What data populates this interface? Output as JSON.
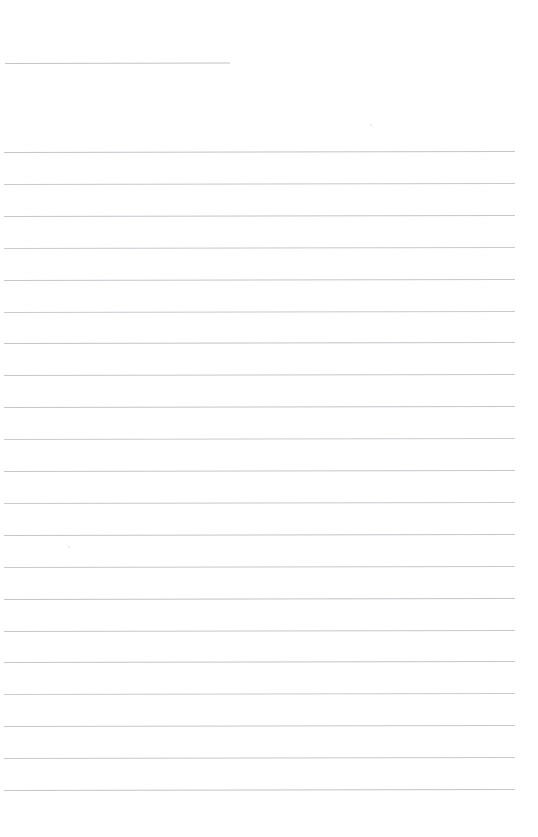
{
  "page": {
    "kind": "blank-lined-worksheet-page",
    "width": 538,
    "height": 837,
    "background_color": "#ffffff",
    "title_text": "",
    "body_text": ""
  },
  "colors": {
    "rule": "#c6c6ca",
    "rule_faint": "#d6d6da",
    "rule_strong": "#bcbcc2",
    "background": "#ffffff",
    "speck": "#e4e4e7"
  },
  "header_rule": {
    "name": "title-blank-rule",
    "x": 5,
    "y": 63,
    "width": 225,
    "color": "#c3c3c8",
    "tilt_deg": -0.12,
    "label": ""
  },
  "body_rules": {
    "count": 21,
    "first_y": 152,
    "spacing": 31.9,
    "x": 4,
    "width": 511,
    "lines": [
      {
        "index": 1,
        "y": 152.0,
        "x": 4,
        "width": 511,
        "color": "#c4c4c9",
        "tilt_deg": -0.1,
        "text": ""
      },
      {
        "index": 2,
        "y": 183.9,
        "x": 4,
        "width": 511,
        "color": "#c8c8cd",
        "tilt_deg": -0.1,
        "text": ""
      },
      {
        "index": 3,
        "y": 215.8,
        "x": 4,
        "width": 511,
        "color": "#c5c5ca",
        "tilt_deg": -0.11,
        "text": ""
      },
      {
        "index": 4,
        "y": 247.7,
        "x": 4,
        "width": 511,
        "color": "#c9c9ce",
        "tilt_deg": -0.1,
        "text": ""
      },
      {
        "index": 5,
        "y": 279.6,
        "x": 4,
        "width": 511,
        "color": "#c6c6cb",
        "tilt_deg": -0.11,
        "text": ""
      },
      {
        "index": 6,
        "y": 311.5,
        "x": 4,
        "width": 511,
        "color": "#cacacf",
        "tilt_deg": -0.1,
        "text": ""
      },
      {
        "index": 7,
        "y": 343.4,
        "x": 4,
        "width": 511,
        "color": "#c4c4c9",
        "tilt_deg": -0.11,
        "text": ""
      },
      {
        "index": 8,
        "y": 375.3,
        "x": 4,
        "width": 511,
        "color": "#c7c7cc",
        "tilt_deg": -0.1,
        "text": ""
      },
      {
        "index": 9,
        "y": 407.2,
        "x": 4,
        "width": 511,
        "color": "#c5c5ca",
        "tilt_deg": -0.11,
        "text": ""
      },
      {
        "index": 10,
        "y": 439.1,
        "x": 4,
        "width": 511,
        "color": "#cbcbd0",
        "tilt_deg": -0.1,
        "text": ""
      },
      {
        "index": 11,
        "y": 471.0,
        "x": 4,
        "width": 511,
        "color": "#c6c6cb",
        "tilt_deg": -0.11,
        "text": ""
      },
      {
        "index": 12,
        "y": 502.9,
        "x": 4,
        "width": 511,
        "color": "#c9c9ce",
        "tilt_deg": -0.1,
        "text": ""
      },
      {
        "index": 13,
        "y": 534.8,
        "x": 4,
        "width": 511,
        "color": "#c5c5ca",
        "tilt_deg": -0.11,
        "text": ""
      },
      {
        "index": 14,
        "y": 566.7,
        "x": 4,
        "width": 511,
        "color": "#c8c8cd",
        "tilt_deg": -0.1,
        "text": ""
      },
      {
        "index": 15,
        "y": 598.6,
        "x": 4,
        "width": 511,
        "color": "#c4c4c9",
        "tilt_deg": -0.11,
        "text": ""
      },
      {
        "index": 16,
        "y": 630.5,
        "x": 4,
        "width": 511,
        "color": "#c7c7cc",
        "tilt_deg": -0.1,
        "text": ""
      },
      {
        "index": 17,
        "y": 662.4,
        "x": 4,
        "width": 511,
        "color": "#c5c5ca",
        "tilt_deg": -0.11,
        "text": ""
      },
      {
        "index": 18,
        "y": 694.3,
        "x": 4,
        "width": 511,
        "color": "#cacacf",
        "tilt_deg": -0.1,
        "text": ""
      },
      {
        "index": 19,
        "y": 726.2,
        "x": 4,
        "width": 511,
        "color": "#c6c6cb",
        "tilt_deg": -0.11,
        "text": ""
      },
      {
        "index": 20,
        "y": 758.1,
        "x": 4,
        "width": 511,
        "color": "#c8c8cd",
        "tilt_deg": -0.1,
        "text": ""
      },
      {
        "index": 21,
        "y": 790.0,
        "x": 4,
        "width": 511,
        "color": "#c4c4c9",
        "tilt_deg": -0.11,
        "text": ""
      }
    ]
  },
  "specks": [
    {
      "name": "scan-speck",
      "x": 68,
      "y": 546
    },
    {
      "name": "scan-speck",
      "x": 370,
      "y": 124
    }
  ]
}
